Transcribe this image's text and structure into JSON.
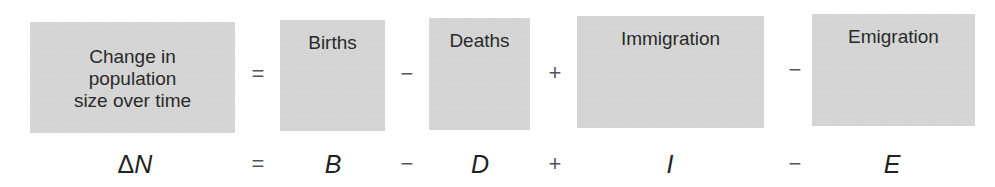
{
  "equation": {
    "word_row": {
      "terms": [
        {
          "label_lines": [
            "Change in",
            "population",
            "size over time"
          ]
        },
        {
          "label": "Births"
        },
        {
          "label": "Deaths"
        },
        {
          "label": "Immigration"
        },
        {
          "label": "Emigration"
        }
      ],
      "operators": [
        "=",
        "−",
        "+",
        "−"
      ]
    },
    "symbol_row": {
      "delta": "Δ",
      "terms": [
        "N",
        "B",
        "D",
        "I",
        "E"
      ],
      "operators": [
        "=",
        "−",
        "+",
        "−"
      ]
    }
  },
  "colors": {
    "box_fill": "#d4d4d4",
    "text": "#2a2a2a",
    "operator": "#555555"
  }
}
